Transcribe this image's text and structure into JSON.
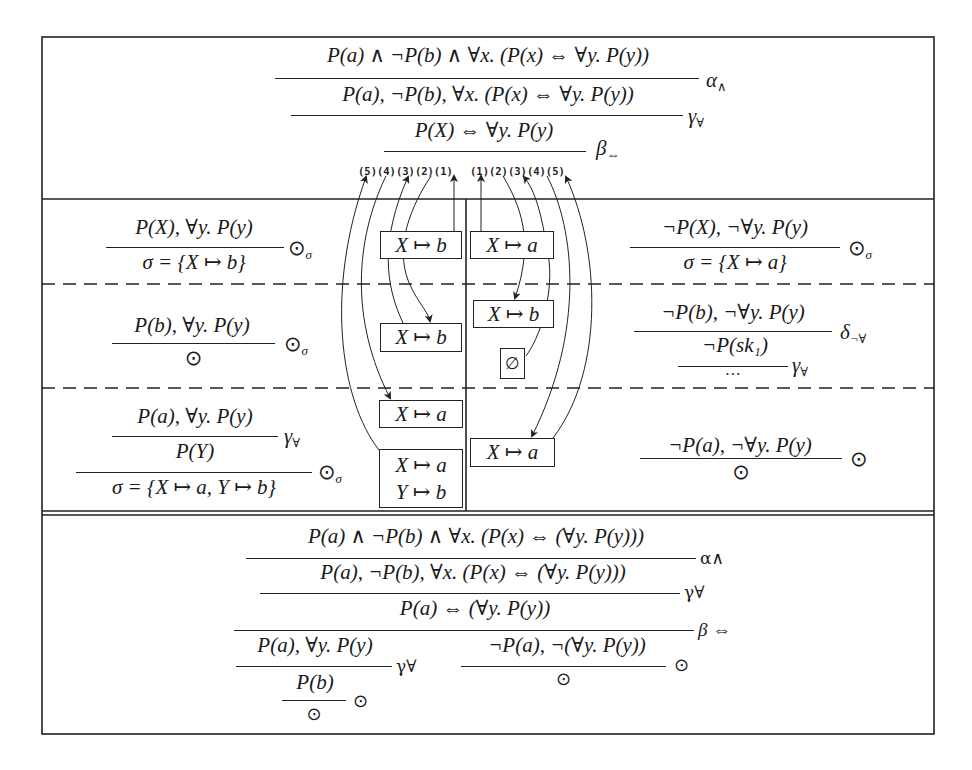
{
  "top_section": {
    "lines": [
      {
        "formula": "P(a) ∧ ¬P(b) ∧ ∀x. (P(x) ⇔ ∀y. P(y))",
        "rule": "α",
        "rule_sub": "∧"
      },
      {
        "formula": "P(a), ¬P(b), ∀x. (P(x) ⇔ ∀y. P(y))",
        "rule": "γ",
        "rule_sub": "∀"
      },
      {
        "formula": "P(X) ⇔ ∀y. P(y)",
        "rule": "β",
        "rule_sub": "⇔"
      }
    ],
    "left_labels": "(5)(4)(3)(2)(1)",
    "right_labels": "(1)(2)(3)(4)(5)"
  },
  "left_branch": {
    "row1": {
      "premise": "P(X), ∀y. P(y)",
      "conclusion": "σ = {X ↦ b}",
      "rule": "⊙",
      "rule_sub": "σ"
    },
    "row2": {
      "premise": "P(b), ∀y. P(y)",
      "conclusion": "⊙",
      "rule": "⊙",
      "rule_sub": "σ"
    },
    "row3": {
      "premise": "P(a), ∀y. P(y)",
      "middle": "P(Y)",
      "conclusion": "σ = {X ↦ a, Y ↦ b}",
      "rule1": "γ",
      "rule1_sub": "∀",
      "rule2": "⊙",
      "rule2_sub": "σ"
    }
  },
  "right_branch": {
    "row1": {
      "premise": "¬P(X), ¬∀y. P(y)",
      "conclusion": "σ = {X ↦ a}",
      "rule": "⊙",
      "rule_sub": "σ"
    },
    "row2": {
      "premise": "¬P(b), ¬∀y. P(y)",
      "middle": "¬P(sk₁)",
      "conclusion": "…",
      "rule1": "δ",
      "rule1_sub": "¬∀",
      "rule2": "γ",
      "rule2_sub": "∀"
    },
    "row3": {
      "premise": "¬P(a), ¬∀y. P(y)",
      "conclusion": "⊙",
      "rule": "⊙"
    }
  },
  "substitution_boxes": {
    "left": [
      {
        "lines": [
          "X ↦ b"
        ]
      },
      {
        "lines": [
          "X ↦ b"
        ]
      },
      {
        "lines": [
          "X ↦ a"
        ]
      },
      {
        "lines": [
          "X ↦ a",
          "Y ↦ b"
        ]
      }
    ],
    "right": [
      {
        "lines": [
          "X ↦ a"
        ]
      },
      {
        "lines": [
          "X ↦ b"
        ]
      },
      {
        "lines": [
          "∅"
        ]
      },
      {
        "lines": [
          "X ↦ a"
        ]
      }
    ]
  },
  "bottom_section": {
    "lines": [
      {
        "formula": "P(a) ∧ ¬P(b) ∧ ∀x. (P(x) ⇔ (∀y. P(y)))",
        "rule": "α∧"
      },
      {
        "formula": "P(a), ¬P(b), ∀x. (P(x) ⇔ (∀y. P(y)))",
        "rule": "γ∀"
      },
      {
        "formula": "P(a) ⇔ (∀y. P(y))",
        "rule": "β ⇔"
      }
    ],
    "left_premise": "P(a), ∀y. P(y)",
    "left_rule": "γ∀",
    "left_middle": "P(b)",
    "left_conclusion": "⊙",
    "left_close_rule": "⊙",
    "right_premise": "¬P(a), ¬(∀y. P(y))",
    "right_conclusion": "⊙",
    "right_rule": "⊙"
  }
}
